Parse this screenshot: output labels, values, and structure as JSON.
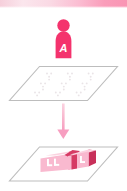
{
  "figure": {
    "title": "Agent placing objects onto a plane",
    "banner": {
      "label": "top-gradient-banner",
      "color_left": "#f8d4de",
      "color_mid": "#fbe3ea",
      "color_right": "#fa9ebb"
    },
    "colors": {
      "accent_pink": "#f4336d",
      "accent_pink_light": "#f8a7c0",
      "accent_pink_pale": "#f9c2d4",
      "block_face": "#f9b9cf",
      "block_face_light": "#fbd3e0",
      "block_side": "#e0476f",
      "block_side_dark": "#c8305a",
      "plane_outline": "#b9b9b9",
      "plane_fill": "#ffffff",
      "dot_color": "#ebe7e9",
      "arrow_color": "#f6a8c2",
      "label_text": "#ffffff",
      "background": "#ffffff"
    },
    "person": {
      "label": "person-icon",
      "badge_letter": "A",
      "description": "Pink humanoid figure with white letter A on the torso"
    },
    "top_plane": {
      "label": "empty-grid-plane",
      "dot_rows": 3,
      "dot_cols": 3,
      "dots_per_cluster": 4,
      "description": "Empty isometric plane marked with faint placement dots"
    },
    "arrow": {
      "label": "downward-arrow",
      "direction": "down"
    },
    "bottom_plane": {
      "label": "populated-plane",
      "description": "Isometric plane holding pink 3D blocks",
      "blocks": [
        {
          "label": "L",
          "position": "left"
        },
        {
          "label": "L",
          "position": "right"
        }
      ]
    }
  }
}
